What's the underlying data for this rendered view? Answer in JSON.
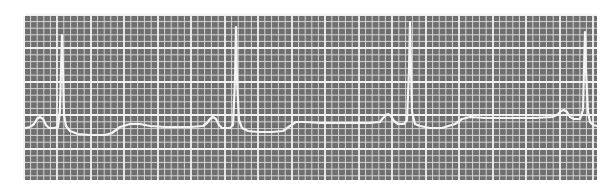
{
  "chart_data": {
    "type": "line",
    "title": "",
    "xlabel": "",
    "ylabel": "",
    "description": "ECG rhythm strip on grid paper, four beats visible",
    "grid": {
      "on": true,
      "left": 25,
      "top": 16,
      "right": 597,
      "bottom": 180,
      "small_cell_px": 6.7,
      "major_every": 5,
      "major_x": [
        24,
        57,
        91,
        124,
        158,
        191,
        225,
        258,
        292,
        325,
        359,
        392,
        426,
        459,
        493,
        526,
        560,
        593
      ],
      "major_y": [
        15,
        48,
        82,
        115,
        149
      ]
    },
    "colors": {
      "background": "#ffffff",
      "paper": "#6f6f6f",
      "grid_minor": "#d6d6d6",
      "grid_major": "#f2f2f2",
      "trace": "#f4f4f4"
    },
    "beats": [
      {
        "p_peak": [
          40,
          117
        ],
        "r_peak": [
          62,
          35
        ]
      },
      {
        "p_peak": [
          213,
          117
        ],
        "r_peak": [
          236,
          27
        ]
      },
      {
        "p_peak": [
          388,
          114
        ],
        "r_peak": [
          410,
          22
        ]
      },
      {
        "p_peak": [
          564,
          110
        ],
        "r_peak": [
          585,
          32
        ]
      }
    ],
    "trace_points": [
      [
        25,
        128
      ],
      [
        30,
        127
      ],
      [
        34,
        124
      ],
      [
        37,
        119
      ],
      [
        40,
        117
      ],
      [
        43,
        119
      ],
      [
        46,
        125
      ],
      [
        49,
        128
      ],
      [
        54,
        128
      ],
      [
        58,
        127
      ],
      [
        60,
        110
      ],
      [
        61,
        70
      ],
      [
        62,
        35
      ],
      [
        63,
        70
      ],
      [
        64,
        115
      ],
      [
        66,
        126
      ],
      [
        70,
        131
      ],
      [
        78,
        134
      ],
      [
        90,
        135
      ],
      [
        105,
        135
      ],
      [
        112,
        133
      ],
      [
        120,
        127
      ],
      [
        130,
        124
      ],
      [
        140,
        124
      ],
      [
        150,
        126
      ],
      [
        165,
        127
      ],
      [
        190,
        127
      ],
      [
        203,
        126
      ],
      [
        207,
        123
      ],
      [
        210,
        119
      ],
      [
        213,
        117
      ],
      [
        216,
        119
      ],
      [
        219,
        125
      ],
      [
        222,
        128
      ],
      [
        230,
        128
      ],
      [
        233,
        125
      ],
      [
        235,
        80
      ],
      [
        236,
        27
      ],
      [
        237,
        80
      ],
      [
        239,
        120
      ],
      [
        242,
        128
      ],
      [
        248,
        131
      ],
      [
        258,
        132
      ],
      [
        272,
        132
      ],
      [
        283,
        131
      ],
      [
        290,
        126
      ],
      [
        296,
        122
      ],
      [
        305,
        122
      ],
      [
        320,
        123
      ],
      [
        345,
        123
      ],
      [
        370,
        123
      ],
      [
        380,
        122
      ],
      [
        383,
        118
      ],
      [
        386,
        115
      ],
      [
        388,
        114
      ],
      [
        391,
        116
      ],
      [
        394,
        121
      ],
      [
        398,
        124
      ],
      [
        404,
        124
      ],
      [
        407,
        120
      ],
      [
        409,
        70
      ],
      [
        410,
        22
      ],
      [
        411,
        70
      ],
      [
        412,
        112
      ],
      [
        415,
        124
      ],
      [
        420,
        126
      ],
      [
        430,
        128
      ],
      [
        442,
        128
      ],
      [
        455,
        124
      ],
      [
        462,
        119
      ],
      [
        470,
        117
      ],
      [
        485,
        118
      ],
      [
        510,
        118
      ],
      [
        535,
        118
      ],
      [
        552,
        117
      ],
      [
        557,
        115
      ],
      [
        561,
        111
      ],
      [
        564,
        110
      ],
      [
        567,
        112
      ],
      [
        570,
        117
      ],
      [
        574,
        119
      ],
      [
        580,
        119
      ],
      [
        583,
        110
      ],
      [
        584,
        70
      ],
      [
        585,
        32
      ],
      [
        586,
        70
      ],
      [
        588,
        112
      ],
      [
        590,
        122
      ],
      [
        593,
        125
      ],
      [
        597,
        126
      ]
    ]
  }
}
